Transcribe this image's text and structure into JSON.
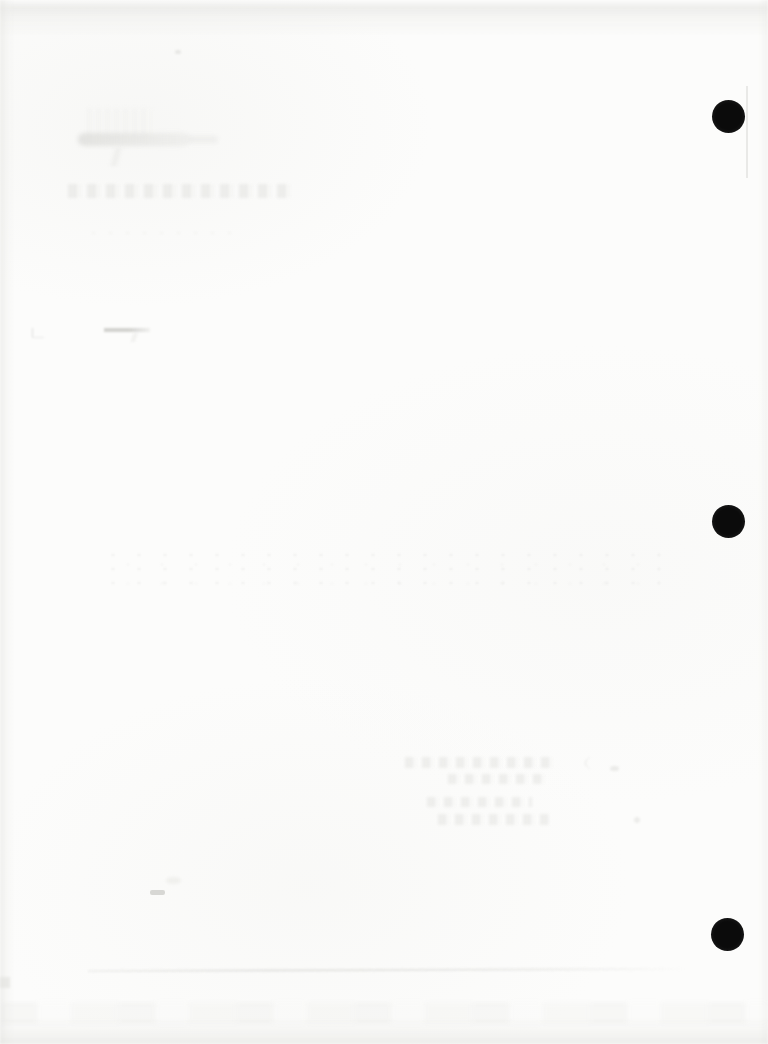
{
  "document": {
    "kind": "blank scanned page (verso) with punched holes and faint ink bleed-through",
    "visible_text": ""
  },
  "colors": {
    "paper": "#fcfcfb",
    "edge_shade": "#e6e6e3",
    "hole": "#0b0b0b",
    "bleed_mark": "#e3e3e0",
    "crease": "#d6d6d3"
  },
  "punch_holes": {
    "count": 3,
    "positions": [
      {
        "cx": 729,
        "cy": 117,
        "r": 16
      },
      {
        "cx": 729,
        "cy": 522,
        "r": 16
      },
      {
        "cx": 728,
        "cy": 935,
        "r": 16
      }
    ]
  },
  "bleedthrough_marks": [
    "smudged-scribble-upper-left",
    "faded-handwriting-line-upper-left",
    "faint-dotted-line-upper-left",
    "small-dash-mark-left",
    "scattered-speck-band-middle",
    "four-line-ghost-text-block-center",
    "tiny-dash-lower-left",
    "faint-crease-line-bottom"
  ]
}
